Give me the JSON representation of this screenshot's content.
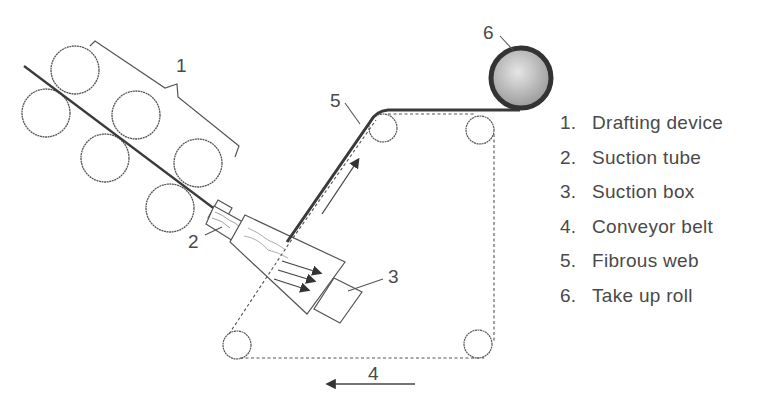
{
  "diagram": {
    "callouts": [
      {
        "id": "1",
        "label": "1",
        "x": 176,
        "y": 55
      },
      {
        "id": "2",
        "label": "2",
        "x": 188,
        "y": 231
      },
      {
        "id": "3",
        "label": "3",
        "x": 388,
        "y": 266
      },
      {
        "id": "4",
        "label": "4",
        "x": 368,
        "y": 363
      },
      {
        "id": "5",
        "label": "5",
        "x": 330,
        "y": 90
      },
      {
        "id": "6",
        "label": "6",
        "x": 483,
        "y": 22
      }
    ],
    "colors": {
      "line": "#555555",
      "web": "#3a3a3a",
      "roll_fill": "#bcbcbc",
      "text": "#4a4a4a"
    }
  },
  "legend": {
    "items": [
      {
        "num": "1.",
        "label": "Drafting device"
      },
      {
        "num": "2.",
        "label": "Suction tube"
      },
      {
        "num": "3.",
        "label": "Suction box"
      },
      {
        "num": "4.",
        "label": "Conveyor belt"
      },
      {
        "num": "5.",
        "label": "Fibrous web"
      },
      {
        "num": "6.",
        "label": "Take up roll"
      }
    ]
  }
}
